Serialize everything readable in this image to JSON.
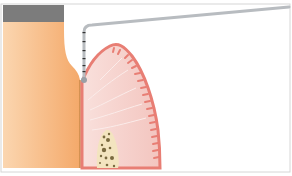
{
  "diagram": {
    "colors": {
      "background": "#ffffff",
      "frame_border": "#d6d6d6",
      "tooth_light": "#fbd6b0",
      "tooth_dark": "#f4a96a",
      "root_line": "#c98a4a",
      "enamel": "#7c7c7c",
      "gingiva_fill": "#f7d6d2",
      "gingiva_edge": "#e87e74",
      "gingiva_lines": "#fbecea",
      "bone_fill": "#f3e4bf",
      "bone_dots": "#7a6a40",
      "probe": "#b8bcc0",
      "probe_marks": "#333333",
      "probe_tip": "#9aa0a6"
    },
    "parts": [
      {
        "name": "enamel",
        "label": ""
      },
      {
        "name": "tooth",
        "label": ""
      },
      {
        "name": "gingiva",
        "label": ""
      },
      {
        "name": "bone",
        "label": ""
      },
      {
        "name": "periodontal-probe",
        "label": ""
      }
    ],
    "probe_markings_count": 6
  }
}
